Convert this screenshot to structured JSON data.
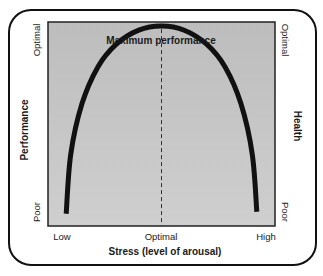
{
  "chart_data": {
    "type": "line",
    "title": "Maximum performance",
    "xlabel": "Stress (level of arousal)",
    "ylabel_left": "Performance",
    "ylabel_right": "Health",
    "x_tick_labels": [
      "Low",
      "Optimal",
      "High"
    ],
    "y_left_tick_labels": [
      "Poor",
      "Optimal"
    ],
    "y_right_tick_labels": [
      "Poor",
      "Optimal"
    ],
    "xlim": [
      0,
      1
    ],
    "ylim": [
      0,
      1
    ],
    "grid": false,
    "optimal_marker": {
      "x": 0.5,
      "style": "dashed"
    },
    "series": [
      {
        "name": "Performance curve (inverted U)",
        "x": [
          0.08,
          0.1,
          0.15,
          0.22,
          0.3,
          0.4,
          0.5,
          0.6,
          0.7,
          0.78,
          0.85,
          0.9,
          0.92
        ],
        "y": [
          0.06,
          0.35,
          0.6,
          0.78,
          0.89,
          0.96,
          0.98,
          0.96,
          0.89,
          0.78,
          0.6,
          0.35,
          0.07
        ]
      }
    ],
    "colors": {
      "plot_background": "#c6c6c6",
      "curve": "#111111",
      "frame": "#111111"
    }
  }
}
